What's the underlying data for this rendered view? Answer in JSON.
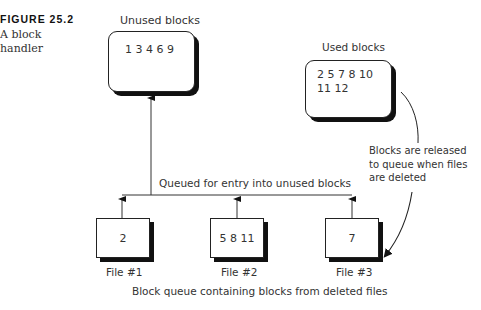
{
  "figure": {
    "number": "FIGURE 25.2",
    "caption_line1": "A block",
    "caption_line2": "handler"
  },
  "unused_blocks": {
    "label": "Unused blocks",
    "values": "1 3 4 6 9"
  },
  "used_blocks": {
    "label": "Used blocks",
    "line1": "2 5 7 8 10",
    "line2": "11 12"
  },
  "release_note": {
    "line1": "Blocks are released",
    "line2": "to queue when files",
    "line3": "are deleted"
  },
  "queue_label": "Queued for entry into unused blocks",
  "files": [
    {
      "label": "File #1",
      "blocks": "2"
    },
    {
      "label": "File #2",
      "blocks": "5 8 11"
    },
    {
      "label": "File #3",
      "blocks": "7"
    }
  ],
  "queue_caption": "Block queue containing blocks from deleted files"
}
